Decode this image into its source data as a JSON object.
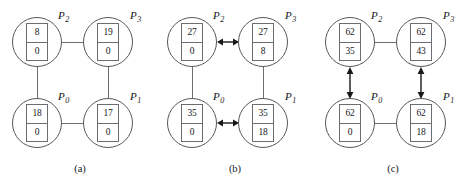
{
  "figure": {
    "background_color": "#ffffff",
    "line_color": "#6b6d70",
    "text_color": "#16181a"
  },
  "panels": [
    {
      "id": "a",
      "caption": "(a)",
      "nodes": [
        {
          "position": "tl",
          "label": "P",
          "subscript": "2",
          "top_value": "8",
          "bottom_value": "0"
        },
        {
          "position": "tr",
          "label": "P",
          "subscript": "3",
          "top_value": "19",
          "bottom_value": "0"
        },
        {
          "position": "bl",
          "label": "P",
          "subscript": "0",
          "top_value": "18",
          "bottom_value": "0"
        },
        {
          "position": "br",
          "label": "P",
          "subscript": "1",
          "top_value": "17",
          "bottom_value": "0"
        }
      ],
      "connectors": [
        {
          "name": "edge-top",
          "orientation": "horizontal",
          "style": "line"
        },
        {
          "name": "edge-bottom",
          "orientation": "horizontal",
          "style": "line"
        },
        {
          "name": "edge-left",
          "orientation": "vertical",
          "style": "line"
        },
        {
          "name": "edge-right",
          "orientation": "vertical",
          "style": "line"
        }
      ]
    },
    {
      "id": "b",
      "caption": "(b)",
      "nodes": [
        {
          "position": "tl",
          "label": "P",
          "subscript": "2",
          "top_value": "27",
          "bottom_value": "0"
        },
        {
          "position": "tr",
          "label": "P",
          "subscript": "3",
          "top_value": "27",
          "bottom_value": "8"
        },
        {
          "position": "bl",
          "label": "P",
          "subscript": "0",
          "top_value": "35",
          "bottom_value": "0"
        },
        {
          "position": "br",
          "label": "P",
          "subscript": "1",
          "top_value": "35",
          "bottom_value": "18"
        }
      ],
      "connectors": [
        {
          "name": "edge-top",
          "orientation": "horizontal",
          "style": "double-arrow"
        },
        {
          "name": "edge-bottom",
          "orientation": "horizontal",
          "style": "double-arrow"
        },
        {
          "name": "edge-left",
          "orientation": "vertical",
          "style": "line"
        },
        {
          "name": "edge-right",
          "orientation": "vertical",
          "style": "line"
        }
      ]
    },
    {
      "id": "c",
      "caption": "(c)",
      "nodes": [
        {
          "position": "tl",
          "label": "P",
          "subscript": "2",
          "top_value": "62",
          "bottom_value": "35"
        },
        {
          "position": "tr",
          "label": "P",
          "subscript": "3",
          "top_value": "62",
          "bottom_value": "43"
        },
        {
          "position": "bl",
          "label": "P",
          "subscript": "0",
          "top_value": "62",
          "bottom_value": "0"
        },
        {
          "position": "br",
          "label": "P",
          "subscript": "1",
          "top_value": "62",
          "bottom_value": "18"
        }
      ],
      "connectors": [
        {
          "name": "edge-top",
          "orientation": "horizontal",
          "style": "line"
        },
        {
          "name": "edge-bottom",
          "orientation": "horizontal",
          "style": "line"
        },
        {
          "name": "edge-left",
          "orientation": "vertical",
          "style": "double-arrow"
        },
        {
          "name": "edge-right",
          "orientation": "vertical",
          "style": "double-arrow"
        }
      ]
    }
  ]
}
